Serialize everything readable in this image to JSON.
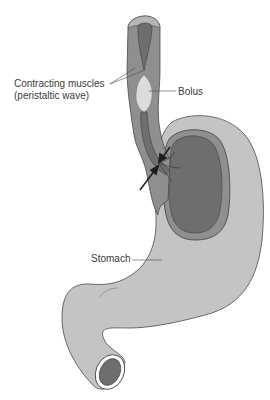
{
  "figure": {
    "type": "anatomical-diagram",
    "colors": {
      "outer_wall": "#c4c4c4",
      "muscle_layer": "#8f8f8f",
      "lumen": "#6e6e6e",
      "bolus": "#dcdcdc",
      "outline": "#4a4a4a",
      "arrow": "#1e1e1e",
      "background": "#ffffff"
    }
  },
  "labels": {
    "contracting_line1": "Contracting muscles",
    "contracting_line2": "(peristaltic wave)",
    "bolus": "Bolus",
    "stomach": "Stomach"
  }
}
